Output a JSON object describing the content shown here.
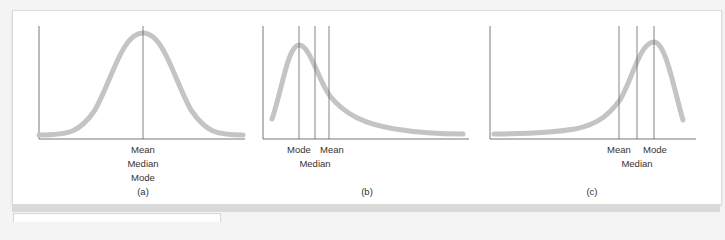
{
  "figure": {
    "panels": [
      {
        "id": "a",
        "caption": "(a)",
        "shape": "symmetric",
        "marker_labels": [
          "Mean",
          "Median",
          "Mode"
        ]
      },
      {
        "id": "b",
        "caption": "(b)",
        "shape": "positively-skewed",
        "marker_labels": {
          "mode": "Mode",
          "mean": "Mean",
          "median": "Median"
        }
      },
      {
        "id": "c",
        "caption": "(c)",
        "shape": "negatively-skewed",
        "marker_labels": {
          "mean": "Mean",
          "mode": "Mode",
          "median": "Median"
        }
      }
    ],
    "colors": {
      "curve": "#c4c4c4",
      "axis": "#555555",
      "marker_line": "#666666",
      "text": "#333333"
    }
  }
}
